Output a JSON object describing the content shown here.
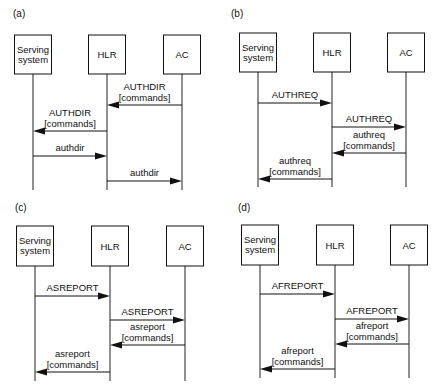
{
  "figure": {
    "panels": [
      {
        "id": "a",
        "label": "(a)",
        "entities": [
          "Serving system",
          "HLR",
          "AC"
        ],
        "messages": [
          {
            "from": "AC",
            "to": "HLR",
            "label": "AUTHDIR",
            "sublabel": "[commands]"
          },
          {
            "from": "HLR",
            "to": "Serving system",
            "label": "AUTHDIR",
            "sublabel": "[commands]"
          },
          {
            "from": "Serving system",
            "to": "HLR",
            "label": "authdir",
            "sublabel": ""
          },
          {
            "from": "HLR",
            "to": "AC",
            "label": "authdir",
            "sublabel": ""
          }
        ]
      },
      {
        "id": "b",
        "label": "(b)",
        "entities": [
          "Serving system",
          "HLR",
          "AC"
        ],
        "messages": [
          {
            "from": "Serving system",
            "to": "HLR",
            "label": "AUTHREQ",
            "sublabel": ""
          },
          {
            "from": "HLR",
            "to": "AC",
            "label": "AUTHREQ",
            "sublabel": ""
          },
          {
            "from": "AC",
            "to": "HLR",
            "label": "authreq",
            "sublabel": "[commands]"
          },
          {
            "from": "HLR",
            "to": "Serving system",
            "label": "authreq",
            "sublabel": "[commands]"
          }
        ]
      },
      {
        "id": "c",
        "label": "(c)",
        "entities": [
          "Serving system",
          "HLR",
          "AC"
        ],
        "messages": [
          {
            "from": "Serving system",
            "to": "HLR",
            "label": "ASREPORT",
            "sublabel": ""
          },
          {
            "from": "HLR",
            "to": "AC",
            "label": "ASREPORT",
            "sublabel": ""
          },
          {
            "from": "AC",
            "to": "HLR",
            "label": "asreport",
            "sublabel": "[commands]"
          },
          {
            "from": "HLR",
            "to": "Serving system",
            "label": "asreport",
            "sublabel": "[commands]"
          }
        ]
      },
      {
        "id": "d",
        "label": "(d)",
        "entities": [
          "Serving system",
          "HLR",
          "AC"
        ],
        "messages": [
          {
            "from": "Serving system",
            "to": "HLR",
            "label": "AFREPORT",
            "sublabel": ""
          },
          {
            "from": "HLR",
            "to": "AC",
            "label": "AFREPORT",
            "sublabel": ""
          },
          {
            "from": "AC",
            "to": "HLR",
            "label": "afreport",
            "sublabel": "[commands]"
          },
          {
            "from": "HLR",
            "to": "Serving system",
            "label": "afreport",
            "sublabel": "[commands]"
          }
        ]
      }
    ]
  }
}
